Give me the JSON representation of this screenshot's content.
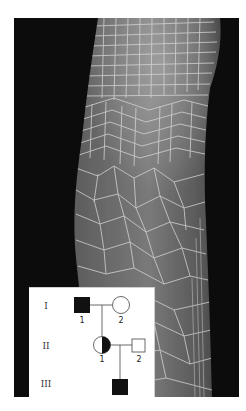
{
  "figure": {
    "photo": {
      "subject": "forearm-with-cracked-scaly-skin",
      "background_color": "#0c0c0c",
      "skin_base_color": "#5a5a5a",
      "crack_line_color": "#d8d8d8"
    },
    "pedigree": {
      "generations": [
        {
          "label": "I",
          "individuals": [
            {
              "number": "1",
              "sex": "male",
              "status": "affected"
            },
            {
              "number": "2",
              "sex": "female",
              "status": "unaffected"
            }
          ]
        },
        {
          "label": "II",
          "individuals": [
            {
              "number": "1",
              "sex": "female",
              "status": "carrier"
            },
            {
              "number": "2",
              "sex": "male",
              "status": "unaffected"
            }
          ]
        },
        {
          "label": "III",
          "individuals": [
            {
              "number": "1",
              "sex": "male",
              "status": "affected"
            }
          ]
        }
      ]
    }
  }
}
